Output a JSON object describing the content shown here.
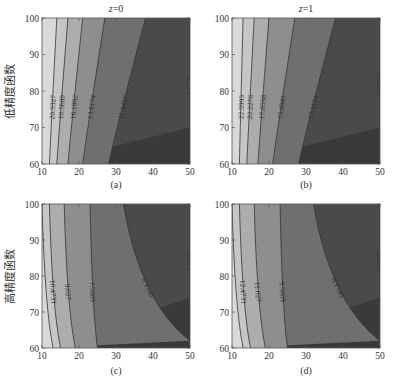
{
  "chart_data": [
    {
      "id": "a",
      "type": "contour",
      "title": "z=0",
      "title_var": "z",
      "title_rest": "=0",
      "caption": "(a)",
      "xlabel": "",
      "ylabel": "低精度函数",
      "xlim": [
        10,
        50
      ],
      "ylim": [
        60,
        100
      ],
      "xticks": [
        10,
        20,
        30,
        40,
        50
      ],
      "yticks": [
        60,
        70,
        80,
        90,
        100
      ],
      "grid": false,
      "colormap": "gray (light = high value, dark = low value)",
      "levels": [
        20.9327,
        18.5609,
        16.1892,
        13.8174,
        11.4457,
        9.0739
      ],
      "contour_labels": [
        "20.9327",
        "18.5609",
        "16.1892",
        "13.8174",
        "11.4457",
        "9.0739"
      ],
      "contour_bottom_x": [
        12,
        14,
        17,
        21,
        28,
        40
      ],
      "contour_top_x": [
        14,
        17,
        21,
        27,
        38,
        50
      ],
      "contour_right_y": [
        null,
        null,
        null,
        null,
        null,
        70
      ]
    },
    {
      "id": "b",
      "type": "contour",
      "title": "z=1",
      "title_var": "z",
      "title_rest": "=1",
      "caption": "(b)",
      "xlabel": "",
      "ylabel": "",
      "xlim": [
        10,
        50
      ],
      "ylim": [
        60,
        100
      ],
      "xticks": [
        10,
        20,
        30,
        40,
        50
      ],
      "yticks": [
        60,
        70,
        80,
        90,
        100
      ],
      "grid": false,
      "colormap": "gray (light = high value, dark = low value)",
      "levels": [
        22.5993,
        20.2276,
        17.8558,
        15.4841,
        13.1124,
        10.7406
      ],
      "contour_labels": [
        "22.5993",
        "20.2276",
        "17.8558",
        "15.4841",
        "13.1124",
        "10.7406"
      ],
      "contour_bottom_x": [
        12,
        14,
        17,
        21,
        28,
        40
      ],
      "contour_top_x": [
        13,
        16,
        20,
        27,
        38,
        50
      ],
      "contour_right_y": [
        null,
        null,
        null,
        null,
        null,
        70
      ]
    },
    {
      "id": "c",
      "type": "contour",
      "title": "",
      "caption": "(c)",
      "xlabel": "",
      "ylabel": "高精度函数",
      "xlim": [
        10,
        50
      ],
      "ylim": [
        60,
        100
      ],
      "xticks": [
        10,
        20,
        30,
        40,
        50
      ],
      "yticks": [
        60,
        70,
        80,
        90,
        100
      ],
      "grid": false,
      "colormap": "gray (light = high value, dark = low value)",
      "levels": [
        11.92,
        10.4731,
        9.027,
        7.5809,
        6.1348,
        4.6887
      ],
      "contour_labels": [
        "",
        "10.4731",
        "9.027",
        "7.5809",
        "6.1348",
        "4.6887"
      ],
      "contour_bottom_x": [
        13,
        15,
        19,
        25,
        34,
        50
      ],
      "contour_top_x": [
        10,
        12,
        16,
        23,
        32,
        50
      ],
      "contour_right_y": [
        null,
        null,
        null,
        null,
        62,
        74
      ]
    },
    {
      "id": "d",
      "type": "contour",
      "title": "",
      "caption": "(d)",
      "xlabel": "",
      "ylabel": "",
      "xlim": [
        10,
        50
      ],
      "ylim": [
        60,
        100
      ],
      "xticks": [
        10,
        20,
        30,
        40,
        50
      ],
      "yticks": [
        60,
        70,
        80,
        90,
        100
      ],
      "grid": false,
      "colormap": "gray (light = high value, dark = low value)",
      "levels": [
        13.92,
        12.4731,
        11.027,
        9.5809,
        8.1348,
        6.6887
      ],
      "contour_labels": [
        "",
        "12.4731",
        "11.027",
        "9.5809",
        "8.1348",
        "6.6887"
      ],
      "contour_bottom_x": [
        13,
        15,
        19,
        25,
        34,
        50
      ],
      "contour_top_x": [
        10,
        12,
        16,
        23,
        32,
        50
      ],
      "contour_right_y": [
        null,
        null,
        null,
        null,
        62,
        74
      ]
    }
  ],
  "figure": {
    "panels": [
      {
        "title": "z=0",
        "caption": "(a)",
        "ylabel": "低精度函数"
      },
      {
        "title": "z=1",
        "caption": "(b)",
        "ylabel": ""
      },
      {
        "title": "",
        "caption": "(c)",
        "ylabel": "高精度函数"
      },
      {
        "title": "",
        "caption": "(d)",
        "ylabel": ""
      }
    ],
    "fill_colors": [
      "#d9d9d9",
      "#c6c6c6",
      "#adadad",
      "#8e8e8e",
      "#6f6f6f",
      "#4a4a4a",
      "#3a3a3a"
    ],
    "line_color": "#333333"
  }
}
